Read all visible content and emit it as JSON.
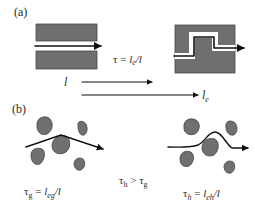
{
  "panel_a": {
    "label": "(a)",
    "equation": {
      "lhs": "τ = ",
      "num": "l",
      "num_sub": "e",
      "slash": "/",
      "den": "l"
    },
    "length_straight": "l",
    "length_effective": {
      "base": "l",
      "sub": "e"
    }
  },
  "panel_b": {
    "label": "(b)",
    "eq_left": {
      "lhs": "τ",
      "lhs_sub": "g",
      "eq": " = ",
      "num": "l",
      "num_sub": "eg",
      "slash": "/",
      "den": "l"
    },
    "eq_mid": {
      "a": "τ",
      "a_sub": "h",
      "op": " > ",
      "b": "τ",
      "b_sub": "g"
    },
    "eq_right": {
      "lhs": "τ",
      "lhs_sub": "h",
      "eq": " = ",
      "num": "l",
      "num_sub": "eh",
      "slash": "/",
      "den": "l"
    }
  },
  "colors": {
    "block": "#6f6f6f",
    "grain": "#707070",
    "path": "#111111",
    "text": "#2a2a2a"
  }
}
